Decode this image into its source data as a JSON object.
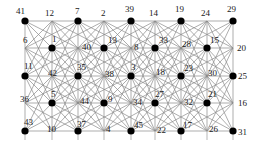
{
  "figure": {
    "kind": "graph-diagram",
    "background_color": "#ffffff",
    "node_fill_color": "#000000",
    "edge_color": "#8a8a8a",
    "frame_color": "#9a9a9a",
    "label_color": "#1a1a1a",
    "width": 258,
    "height": 154,
    "grid_cols": 9,
    "grid_rows": 5
  },
  "chart_data": {
    "type": "scatter",
    "title": "",
    "xlabel": "",
    "ylabel": "",
    "grid": true,
    "legend": "none",
    "xlim": [
      0,
      8
    ],
    "ylim": [
      0,
      4
    ],
    "nodes": [
      {
        "id": "41",
        "label": "41",
        "col": 0,
        "row": 0,
        "x": 25,
        "y": 21,
        "dot": true,
        "label_dx": -9,
        "label_dy": -14
      },
      {
        "id": "12",
        "label": "12",
        "col": 1,
        "row": 0,
        "x": 52,
        "y": 21,
        "dot": false,
        "label_dx": -7,
        "label_dy": -12
      },
      {
        "id": "7",
        "label": "7",
        "col": 2,
        "row": 0,
        "x": 78,
        "y": 21,
        "dot": true,
        "label_dx": -3,
        "label_dy": -14
      },
      {
        "id": "2",
        "label": "2",
        "col": 3,
        "row": 0,
        "x": 104,
        "y": 21,
        "dot": false,
        "label_dx": -3,
        "label_dy": -12
      },
      {
        "id": "39",
        "label": "39",
        "col": 4,
        "row": 0,
        "x": 131,
        "y": 21,
        "dot": true,
        "label_dx": -6,
        "label_dy": -16
      },
      {
        "id": "14",
        "label": "14",
        "col": 5,
        "row": 0,
        "x": 155,
        "y": 21,
        "dot": false,
        "label_dx": -6,
        "label_dy": -12
      },
      {
        "id": "19",
        "label": "19",
        "col": 6,
        "row": 0,
        "x": 181,
        "y": 21,
        "dot": true,
        "label_dx": -6,
        "label_dy": -16
      },
      {
        "id": "24",
        "label": "24",
        "col": 7,
        "row": 0,
        "x": 207,
        "y": 21,
        "dot": false,
        "label_dx": -6,
        "label_dy": -12
      },
      {
        "id": "29",
        "label": "29",
        "col": 8,
        "row": 0,
        "x": 233,
        "y": 21,
        "dot": true,
        "label_dx": -6,
        "label_dy": -16
      },
      {
        "id": "6",
        "label": "6",
        "col": 0,
        "row": 1,
        "x": 25,
        "y": 48,
        "dot": false,
        "label_dx": -2,
        "label_dy": -12
      },
      {
        "id": "1",
        "label": "1",
        "col": 1,
        "row": 1,
        "x": 52,
        "y": 48,
        "dot": true,
        "label_dx": 0,
        "label_dy": -13
      },
      {
        "id": "40",
        "label": "40",
        "col": 2,
        "row": 1,
        "x": 78,
        "y": 48,
        "dot": false,
        "label_dx": 4,
        "label_dy": -5
      },
      {
        "id": "13",
        "label": "13",
        "col": 3,
        "row": 1,
        "x": 104,
        "y": 48,
        "dot": true,
        "label_dx": 4,
        "label_dy": -12
      },
      {
        "id": "8",
        "label": "8",
        "col": 4,
        "row": 1,
        "x": 131,
        "y": 48,
        "dot": false,
        "label_dx": 3,
        "label_dy": -5
      },
      {
        "id": "33",
        "label": "33",
        "col": 5,
        "row": 1,
        "x": 155,
        "y": 48,
        "dot": true,
        "label_dx": 4,
        "label_dy": -12
      },
      {
        "id": "28",
        "label": "28",
        "col": 6,
        "row": 1,
        "x": 181,
        "y": 48,
        "dot": false,
        "label_dx": 1,
        "label_dy": -8
      },
      {
        "id": "15",
        "label": "15",
        "col": 7,
        "row": 1,
        "x": 207,
        "y": 48,
        "dot": true,
        "label_dx": 3,
        "label_dy": -12
      },
      {
        "id": "20",
        "label": "20",
        "col": 8,
        "row": 1,
        "x": 233,
        "y": 48,
        "dot": false,
        "label_dx": 4,
        "label_dy": -4
      },
      {
        "id": "11",
        "label": "11",
        "col": 0,
        "row": 2,
        "x": 25,
        "y": 76,
        "dot": true,
        "label_dx": -1,
        "label_dy": -14
      },
      {
        "id": "42",
        "label": "42",
        "col": 1,
        "row": 2,
        "x": 52,
        "y": 76,
        "dot": false,
        "label_dx": -4,
        "label_dy": -7
      },
      {
        "id": "35",
        "label": "35",
        "col": 2,
        "row": 2,
        "x": 78,
        "y": 76,
        "dot": true,
        "label_dx": -1,
        "label_dy": -13
      },
      {
        "id": "38",
        "label": "38",
        "col": 3,
        "row": 2,
        "x": 104,
        "y": 76,
        "dot": false,
        "label_dx": 1,
        "label_dy": -6
      },
      {
        "id": "3",
        "label": "3",
        "col": 4,
        "row": 2,
        "x": 131,
        "y": 76,
        "dot": true,
        "label_dx": 0,
        "label_dy": -13
      },
      {
        "id": "18",
        "label": "18",
        "col": 5,
        "row": 2,
        "x": 155,
        "y": 76,
        "dot": false,
        "label_dx": 1,
        "label_dy": -8
      },
      {
        "id": "23",
        "label": "23",
        "col": 6,
        "row": 2,
        "x": 181,
        "y": 76,
        "dot": true,
        "label_dx": 3,
        "label_dy": -12
      },
      {
        "id": "30",
        "label": "30",
        "col": 7,
        "row": 2,
        "x": 207,
        "y": 76,
        "dot": false,
        "label_dx": 1,
        "label_dy": -7
      },
      {
        "id": "25",
        "label": "25",
        "col": 8,
        "row": 2,
        "x": 233,
        "y": 76,
        "dot": true,
        "label_dx": 5,
        "label_dy": -4
      },
      {
        "id": "36",
        "label": "36",
        "col": 0,
        "row": 3,
        "x": 25,
        "y": 103,
        "dot": false,
        "label_dx": -5,
        "label_dy": -8
      },
      {
        "id": "5",
        "label": "5",
        "col": 1,
        "row": 3,
        "x": 52,
        "y": 103,
        "dot": true,
        "label_dx": -1,
        "label_dy": -13
      },
      {
        "id": "44",
        "label": "44",
        "col": 2,
        "row": 3,
        "x": 78,
        "y": 103,
        "dot": false,
        "label_dx": 2,
        "label_dy": -6
      },
      {
        "id": "9",
        "label": "9",
        "col": 3,
        "row": 3,
        "x": 104,
        "y": 103,
        "dot": true,
        "label_dx": 4,
        "label_dy": -8
      },
      {
        "id": "34",
        "label": "34",
        "col": 4,
        "row": 3,
        "x": 131,
        "y": 103,
        "dot": false,
        "label_dx": 2,
        "label_dy": -5
      },
      {
        "id": "27",
        "label": "27",
        "col": 5,
        "row": 3,
        "x": 155,
        "y": 103,
        "dot": true,
        "label_dx": 0,
        "label_dy": -13
      },
      {
        "id": "32",
        "label": "32",
        "col": 6,
        "row": 3,
        "x": 181,
        "y": 103,
        "dot": false,
        "label_dx": 3,
        "label_dy": -5
      },
      {
        "id": "21",
        "label": "21",
        "col": 7,
        "row": 3,
        "x": 207,
        "y": 103,
        "dot": true,
        "label_dx": 1,
        "label_dy": -13
      },
      {
        "id": "16",
        "label": "16",
        "col": 8,
        "row": 3,
        "x": 233,
        "y": 103,
        "dot": false,
        "label_dx": 5,
        "label_dy": -4
      },
      {
        "id": "43",
        "label": "43",
        "col": 0,
        "row": 4,
        "x": 25,
        "y": 131,
        "dot": true,
        "label_dx": -1,
        "label_dy": -13
      },
      {
        "id": "10",
        "label": "10",
        "col": 1,
        "row": 4,
        "x": 52,
        "y": 131,
        "dot": false,
        "label_dx": -5,
        "label_dy": -6
      },
      {
        "id": "37",
        "label": "37",
        "col": 2,
        "row": 4,
        "x": 78,
        "y": 131,
        "dot": true,
        "label_dx": -1,
        "label_dy": -11
      },
      {
        "id": "4",
        "label": "4",
        "col": 3,
        "row": 4,
        "x": 104,
        "y": 131,
        "dot": false,
        "label_dx": 2,
        "label_dy": -6
      },
      {
        "id": "45",
        "label": "45",
        "col": 4,
        "row": 4,
        "x": 131,
        "y": 131,
        "dot": true,
        "label_dx": 3,
        "label_dy": -10
      },
      {
        "id": "22",
        "label": "22",
        "col": 5,
        "row": 4,
        "x": 155,
        "y": 131,
        "dot": false,
        "label_dx": 2,
        "label_dy": -5
      },
      {
        "id": "17",
        "label": "17",
        "col": 6,
        "row": 4,
        "x": 181,
        "y": 131,
        "dot": true,
        "label_dx": 2,
        "label_dy": -10
      },
      {
        "id": "26",
        "label": "26",
        "col": 7,
        "row": 4,
        "x": 207,
        "y": 131,
        "dot": false,
        "label_dx": 2,
        "label_dy": -6
      },
      {
        "id": "31",
        "label": "31",
        "col": 8,
        "row": 4,
        "x": 233,
        "y": 131,
        "dot": true,
        "label_dx": 5,
        "label_dy": -3
      }
    ],
    "edge_rules": {
      "horizontal": true,
      "vertical": true,
      "diagonal_down_right": true,
      "diagonal_down_left": true,
      "knight_long": true
    }
  }
}
